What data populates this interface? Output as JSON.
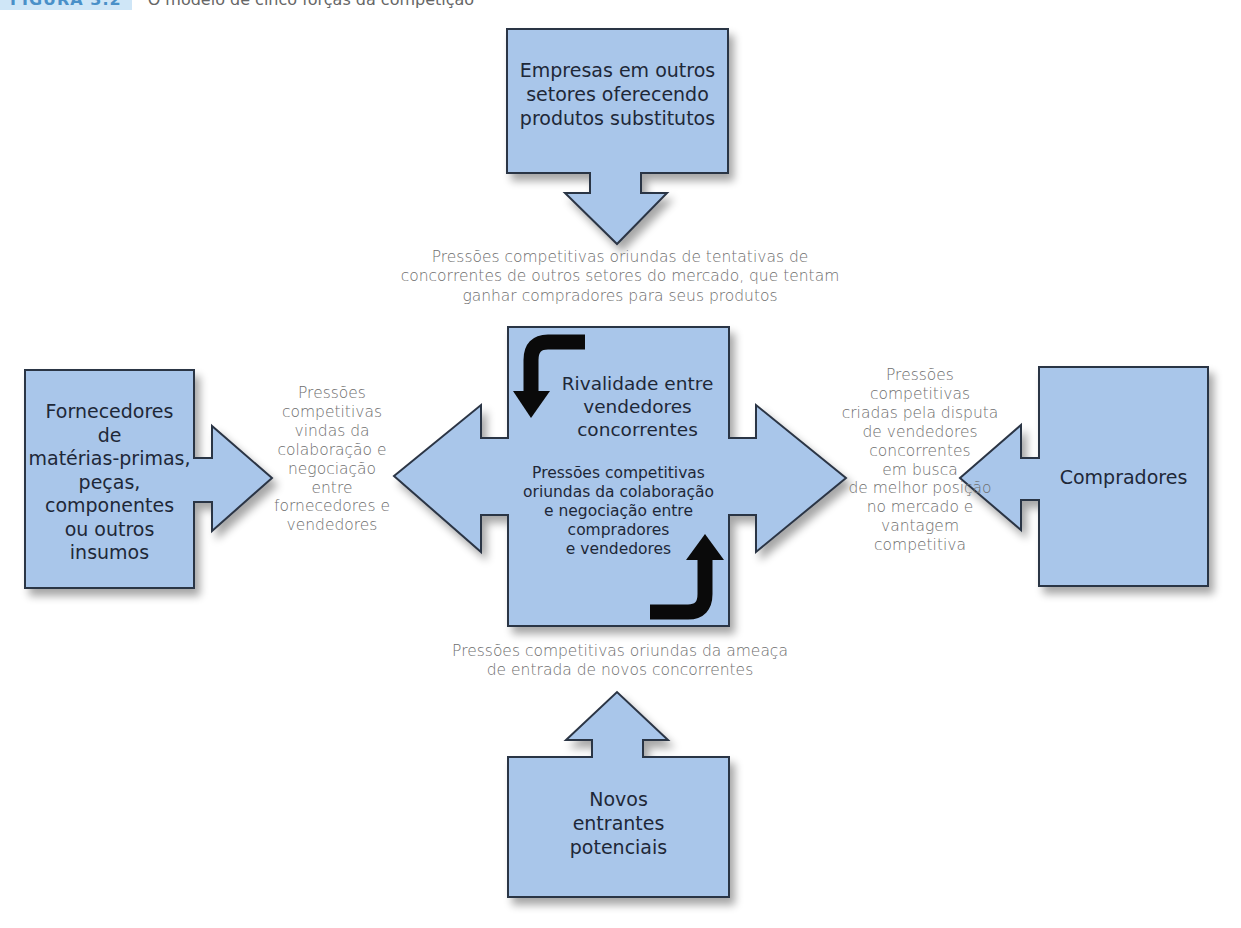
{
  "caption": {
    "label": "FIGURA 3.2",
    "title": "O modelo de cinco forças da competição"
  },
  "colors": {
    "box_fill": "#a9c6ea",
    "box_stroke": "#2c3545",
    "arrow_fill": "#a9c6ea",
    "curved_arrow": "#0a0a0a",
    "pressure_text": "#6e6e6e",
    "box_text": "#1e2838"
  },
  "forces": {
    "substitutes": {
      "box_lines": [
        "Empresas em outros",
        "setores oferecendo",
        "produtos substitutos"
      ],
      "pressure_lines": [
        "Pressões competitivas oriundas de tentativas de",
        "concorrentes de outros setores do mercado, que tentam",
        "ganhar compradores para seus produtos"
      ]
    },
    "suppliers": {
      "box_lines": [
        "Fornecedores",
        "de",
        "matérias-primas,",
        "peças,",
        "componentes",
        "ou outros",
        "insumos"
      ],
      "pressure_lines": [
        "Pressões",
        "competitivas",
        "vindas da",
        "colaboração e",
        "negociação",
        "entre",
        "fornecedores e",
        "vendedores"
      ]
    },
    "rivalry": {
      "title_lines": [
        "Rivalidade entre",
        "vendedores",
        "concorrentes"
      ],
      "sub_lines": [
        "Pressões competitivas",
        "oriundas da colaboração",
        "e negociação entre",
        "compradores",
        "e vendedores"
      ]
    },
    "buyers": {
      "box_lines": [
        "Compradores"
      ],
      "pressure_lines": [
        "Pressões",
        "competitivas",
        "criadas pela disputa",
        "de vendedores",
        "concorrentes",
        "em busca",
        "de melhor posição",
        "no mercado e",
        "vantagem",
        "competitiva"
      ]
    },
    "new_entrants": {
      "box_lines": [
        "Novos",
        "entrantes",
        "potenciais"
      ],
      "pressure_lines": [
        "Pressões competitivas oriundas da ameaça",
        "de entrada de novos concorrentes"
      ]
    }
  }
}
